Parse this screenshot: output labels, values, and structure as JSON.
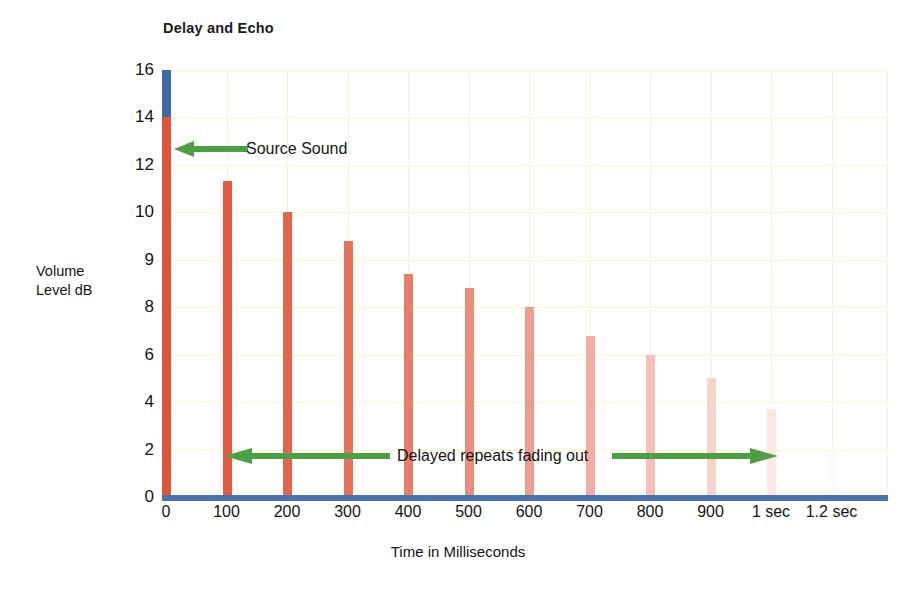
{
  "chart_data": {
    "type": "bar",
    "title": "Delay and Echo",
    "xlabel": "Time in Milliseconds",
    "ylabel": "Volume Level dB",
    "grid": true,
    "legend": "none",
    "categories": [
      "0",
      "100",
      "200",
      "300",
      "400",
      "500",
      "600",
      "700",
      "800",
      "900",
      "1 sec",
      "1.2 sec"
    ],
    "y_tick_labels": [
      "16",
      "14",
      "12",
      "10",
      "9",
      "8",
      "6",
      "4",
      "2",
      "0"
    ],
    "ylim": [
      0,
      16
    ],
    "series": [
      {
        "name": "Volume Level dB",
        "values": [
          14.0,
          11.3,
          10.0,
          9.4,
          8.7,
          8.4,
          8.0,
          6.8,
          6.0,
          5.0,
          3.7,
          2.1
        ]
      }
    ],
    "source_peak": {
      "label": "source peak segment",
      "from": 14,
      "to": 16,
      "color": "#3d6ba5"
    },
    "bar_color": "#e0543c",
    "baseline_color": "#4a72ab",
    "gridline_color": "#f7f2cf",
    "annotations": [
      {
        "name": "source-sound",
        "text": "Source Sound",
        "arrow": "left",
        "color": "#4e9e46"
      },
      {
        "name": "delayed-repeats",
        "text": "Delayed repeats fading out",
        "arrow": "double",
        "color": "#4e9e46"
      }
    ]
  },
  "figure": {
    "title": "Delay and Echo",
    "y_axis_title_line1": "Volume",
    "y_axis_title_line2": "Level dB",
    "x_axis_title": "Time in Milliseconds",
    "annotation_source_sound": "Source Sound",
    "annotation_delayed_repeats": "Delayed repeats fading out",
    "caption_remnant": ""
  }
}
